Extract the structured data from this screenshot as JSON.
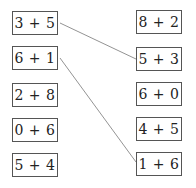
{
  "left_column": [
    {
      "label": "3 + 5"
    },
    {
      "label": "6 + 1"
    },
    {
      "label": "2 + 8"
    },
    {
      "label": "0 + 6"
    },
    {
      "label": "5 + 4"
    }
  ],
  "right_column": [
    {
      "label": "8 + 2"
    },
    {
      "label": "5 + 3"
    },
    {
      "label": "6 + 0"
    },
    {
      "label": "4 + 5"
    },
    {
      "label": "1 + 6"
    }
  ],
  "connections": [
    {
      "from": "3 + 5",
      "to": "5 + 3"
    },
    {
      "from": "6 + 1",
      "to": "1 + 6"
    }
  ],
  "line_color": "#777777"
}
